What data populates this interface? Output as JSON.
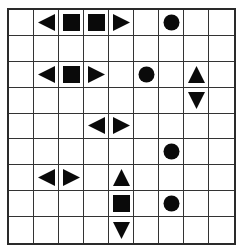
{
  "puzzle": {
    "type": "battleship",
    "rows": 9,
    "cols": 9,
    "piece_color": "#0a0a0a",
    "grid_line_color": "#333333",
    "pieces": [
      {
        "row": 0,
        "col": 1,
        "shape": "end-left",
        "icon": "triangle-left-icon"
      },
      {
        "row": 0,
        "col": 2,
        "shape": "middle",
        "icon": "square-icon"
      },
      {
        "row": 0,
        "col": 3,
        "shape": "middle",
        "icon": "square-icon"
      },
      {
        "row": 0,
        "col": 4,
        "shape": "end-right",
        "icon": "triangle-right-icon"
      },
      {
        "row": 0,
        "col": 6,
        "shape": "submarine",
        "icon": "circle-icon"
      },
      {
        "row": 2,
        "col": 1,
        "shape": "end-left",
        "icon": "triangle-left-icon"
      },
      {
        "row": 2,
        "col": 2,
        "shape": "middle",
        "icon": "square-icon"
      },
      {
        "row": 2,
        "col": 3,
        "shape": "end-right",
        "icon": "triangle-right-icon"
      },
      {
        "row": 2,
        "col": 5,
        "shape": "submarine",
        "icon": "circle-icon"
      },
      {
        "row": 2,
        "col": 7,
        "shape": "end-top",
        "icon": "triangle-up-icon"
      },
      {
        "row": 3,
        "col": 7,
        "shape": "end-bottom",
        "icon": "triangle-down-icon"
      },
      {
        "row": 4,
        "col": 3,
        "shape": "end-left",
        "icon": "triangle-left-icon"
      },
      {
        "row": 4,
        "col": 4,
        "shape": "end-right",
        "icon": "triangle-right-icon"
      },
      {
        "row": 5,
        "col": 6,
        "shape": "submarine",
        "icon": "circle-icon"
      },
      {
        "row": 6,
        "col": 1,
        "shape": "end-left",
        "icon": "triangle-left-icon"
      },
      {
        "row": 6,
        "col": 2,
        "shape": "end-right",
        "icon": "triangle-right-icon"
      },
      {
        "row": 6,
        "col": 4,
        "shape": "end-top",
        "icon": "triangle-up-icon"
      },
      {
        "row": 7,
        "col": 4,
        "shape": "middle",
        "icon": "square-icon"
      },
      {
        "row": 7,
        "col": 6,
        "shape": "submarine",
        "icon": "circle-icon"
      },
      {
        "row": 8,
        "col": 4,
        "shape": "end-bottom",
        "icon": "triangle-down-icon"
      }
    ]
  }
}
